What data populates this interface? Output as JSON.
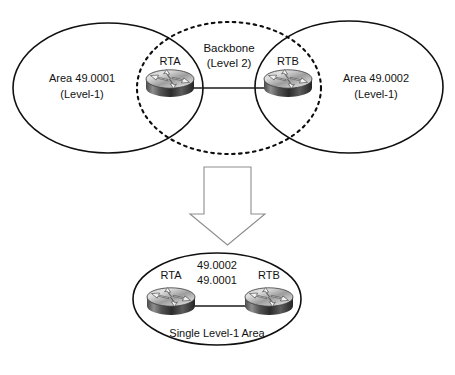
{
  "diagram": {
    "top": {
      "left_area": {
        "line1": "Area 49.0001",
        "line2": "(Level-1)"
      },
      "right_area": {
        "line1": "Area 49.0002",
        "line2": "(Level-1)"
      },
      "backbone": {
        "line1": "Backbone",
        "line2": "(Level 2)"
      },
      "routers": [
        {
          "label": "RTA"
        },
        {
          "label": "RTB"
        }
      ]
    },
    "transform_arrow": {
      "direction": "down",
      "icon": "down-block-arrow-icon"
    },
    "bottom": {
      "addresses": [
        "49.0002",
        "49.0001"
      ],
      "routers": [
        {
          "label": "RTA"
        },
        {
          "label": "RTB"
        }
      ],
      "caption": "Single Level-1 Area"
    },
    "colors": {
      "stroke": "#101010",
      "arrow_outline": "#8d8d8d",
      "background": "#ffffff",
      "router_dark": "#2f2f2f",
      "router_light": "#d8d8d8"
    }
  }
}
